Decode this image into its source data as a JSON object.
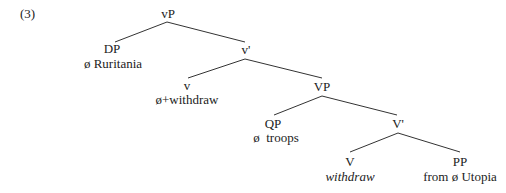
{
  "example_number": "(3)",
  "tree": {
    "vP": {
      "label": "vP"
    },
    "DP": {
      "label": "DP",
      "content": "ø Ruritania"
    },
    "v_bar": {
      "label": "v'"
    },
    "v": {
      "label": "v",
      "content": "ø+withdraw"
    },
    "VP": {
      "label": "VP"
    },
    "QP": {
      "label": "QP",
      "content": "ø  troops"
    },
    "V_bar": {
      "label": "V'"
    },
    "V": {
      "label": "V",
      "content": "withdraw"
    },
    "PP": {
      "label": "PP",
      "content": "from ø Utopia"
    }
  },
  "colors": {
    "text": "#222222",
    "line": "#333333",
    "background": "#ffffff"
  }
}
